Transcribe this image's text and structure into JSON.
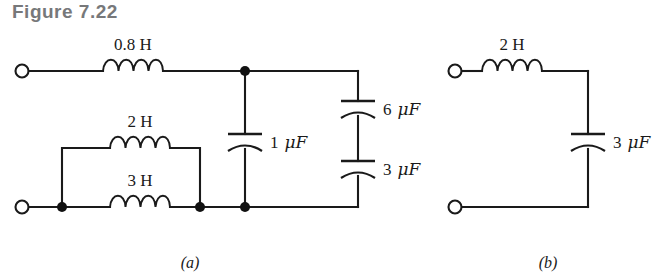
{
  "figure": {
    "title": "Figure 7.22",
    "title_color": "#77787a",
    "line_color": "#1a1a1a",
    "background": "#ffffff"
  },
  "subfigures": [
    {
      "id": "a",
      "caption": "(a)",
      "components": [
        {
          "name": "inductor-0-8h",
          "label": "0.8 H",
          "value": "0.8",
          "unit": "H",
          "kind": "inductor"
        },
        {
          "name": "inductor-2h",
          "label": "2 H",
          "value": "2",
          "unit": "H",
          "kind": "inductor"
        },
        {
          "name": "inductor-3h",
          "label": "3 H",
          "value": "3",
          "unit": "H",
          "kind": "inductor"
        },
        {
          "name": "capacitor-1uf",
          "label": "1 μF",
          "value": "1",
          "unit": "μF",
          "kind": "capacitor"
        },
        {
          "name": "capacitor-6uf",
          "label": "6 μF",
          "value": "6",
          "unit": "μF",
          "kind": "capacitor"
        },
        {
          "name": "capacitor-3uf-a",
          "label": "3 μF",
          "value": "3",
          "unit": "μF",
          "kind": "capacitor"
        }
      ],
      "label_1uf_num": "1",
      "label_6uf_num": "6",
      "label_3uf_num": "3",
      "unit_farad": "μF",
      "label_08h": "0.8 H",
      "label_2h": "2 H",
      "label_3h": "3 H"
    },
    {
      "id": "b",
      "caption": "(b)",
      "components": [
        {
          "name": "inductor-2h-b",
          "label": "2 H",
          "value": "2",
          "unit": "H",
          "kind": "inductor"
        },
        {
          "name": "capacitor-3uf-b",
          "label": "3 μF",
          "value": "3",
          "unit": "μF",
          "kind": "capacitor"
        }
      ],
      "label_2h": "2 H",
      "label_3uf_num": "3",
      "unit_farad": "μF"
    }
  ]
}
